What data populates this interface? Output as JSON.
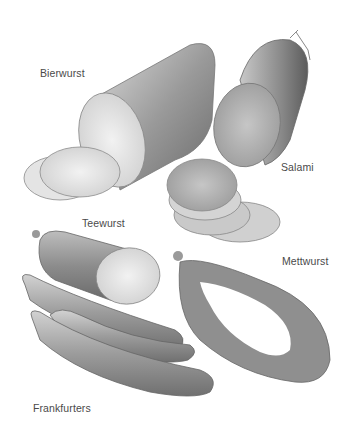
{
  "illustration": {
    "subject": "German sausages pencil illustration",
    "labels": [
      {
        "id": "bierwurst",
        "text": "Bierwurst"
      },
      {
        "id": "salami",
        "text": "Salami"
      },
      {
        "id": "teewurst",
        "text": "Teewurst"
      },
      {
        "id": "mettwurst",
        "text": "Mettwurst"
      },
      {
        "id": "frankfurters",
        "text": "Frankfurters"
      }
    ],
    "colors": {
      "background": "#ffffff",
      "label": "#4a4a4a",
      "shade_dark": "#6e6e6e",
      "shade_mid": "#a8a8a8",
      "shade_light": "#dcdcdc"
    }
  }
}
